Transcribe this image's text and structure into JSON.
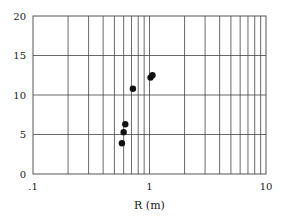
{
  "chart_data": {
    "type": "scatter",
    "title": "",
    "xlabel": "R (m)",
    "ylabel": "",
    "xscale": "log",
    "xlim": [
      0.1,
      10
    ],
    "ylim": [
      0,
      20
    ],
    "x_ticks": [
      0.1,
      1,
      10
    ],
    "x_tick_labels": [
      ".1",
      "1",
      "10"
    ],
    "y_ticks": [
      0,
      5,
      10,
      15,
      20
    ],
    "y_tick_labels": [
      "0",
      "5",
      "10",
      "15",
      "20"
    ],
    "grid": true,
    "legend": null,
    "series": [
      {
        "name": "data",
        "marker": "filled-circle",
        "color": "#111111",
        "points": [
          {
            "x": 0.58,
            "y": 3.9
          },
          {
            "x": 0.6,
            "y": 5.3
          },
          {
            "x": 0.62,
            "y": 6.3
          },
          {
            "x": 0.72,
            "y": 10.8
          },
          {
            "x": 1.02,
            "y": 12.2
          },
          {
            "x": 1.06,
            "y": 12.5
          }
        ]
      }
    ]
  },
  "layout": {
    "plot_left": 33,
    "plot_right": 266,
    "plot_top": 16,
    "plot_bottom": 174
  }
}
